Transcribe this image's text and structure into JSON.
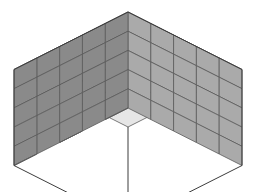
{
  "figure": {
    "background_color": "#ffffff"
  },
  "geometry": {
    "projection": "isometric",
    "grid_x": 5,
    "grid_y": 5,
    "grid_z": 5,
    "total_cubes_visible_top_cells": 25,
    "apex_x": 128,
    "apex_y": 12,
    "half_width": 22.8,
    "half_depth": 11.5,
    "cube_height": 19.2,
    "left_corner_x": 14,
    "left_corner_y": 47,
    "right_corner_x": 246,
    "right_corner_y": 47,
    "front_corner_x": 128,
    "front_corner_top_y": 82,
    "front_corner_bottom_y": 178
  },
  "colors": {
    "top_face": "#e6e6e6",
    "right_face": "#aaaaaa",
    "left_face": "#8a8a8a",
    "edge": "#5a5a5a",
    "outline": "#3c3c3c",
    "background": "#ffffff"
  },
  "faces": {
    "top_label": "top face",
    "left_label": "left wall face",
    "right_label": "right wall face"
  },
  "chart_data": {
    "type": "diagram",
    "shape": "rectangular block of unit cubes",
    "dimensions": {
      "width": 5,
      "depth": 5,
      "height": 5
    },
    "visible_top_cells": 25,
    "visible_left_wall_columns": 5,
    "visible_left_wall_rows": 5,
    "visible_right_wall_columns": 5,
    "visible_right_wall_rows": 5,
    "face_shades": {
      "top": "#e6e6e6",
      "right": "#aaaaaa",
      "left": "#8a8a8a"
    }
  }
}
